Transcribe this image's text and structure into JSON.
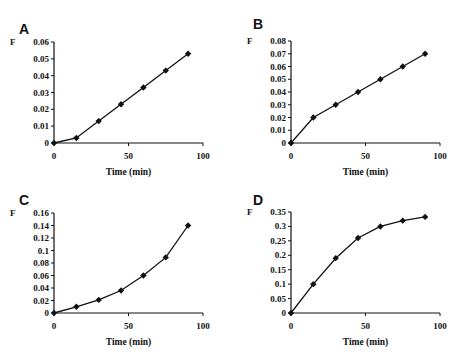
{
  "chart_data": [
    {
      "id": "A",
      "type": "line",
      "title": "A",
      "xlabel": "Time (min)",
      "ylabel": "F",
      "x": [
        0,
        15,
        30,
        45,
        60,
        75,
        90
      ],
      "series": [
        {
          "name": "F",
          "values": [
            0,
            0.003,
            0.013,
            0.023,
            0.033,
            0.043,
            0.053
          ],
          "marker": "diamond"
        }
      ],
      "xlim": [
        0,
        100
      ],
      "ylim": [
        0,
        0.06
      ],
      "xticks": [
        0,
        50,
        100
      ],
      "xtick_labels": [
        "0",
        "50",
        "100"
      ],
      "yticks": [
        0,
        0.01,
        0.02,
        0.03,
        0.04,
        0.05,
        0.06
      ],
      "ytick_labels": [
        "0",
        "0.01",
        "0.02",
        "0.03",
        "0.04",
        "0.05",
        "0.06"
      ],
      "grid": false,
      "legend": null
    },
    {
      "id": "B",
      "type": "line",
      "title": "B",
      "xlabel": "Time (min)",
      "ylabel": "F",
      "x": [
        0,
        15,
        30,
        45,
        60,
        75,
        90
      ],
      "series": [
        {
          "name": "F",
          "values": [
            0,
            0.02,
            0.03,
            0.04,
            0.05,
            0.06,
            0.07
          ],
          "marker": "diamond"
        }
      ],
      "xlim": [
        0,
        100
      ],
      "ylim": [
        0,
        0.08
      ],
      "xticks": [
        0,
        50,
        100
      ],
      "xtick_labels": [
        "0",
        "50",
        "100"
      ],
      "yticks": [
        0,
        0.01,
        0.02,
        0.03,
        0.04,
        0.05,
        0.06,
        0.07,
        0.08
      ],
      "ytick_labels": [
        "0",
        "0.01",
        "0.02",
        "0.03",
        "0.04",
        "0.05",
        "0.06",
        "0.07",
        "0.08"
      ],
      "grid": false,
      "legend": null
    },
    {
      "id": "C",
      "type": "line",
      "title": "C",
      "xlabel": "Time (min)",
      "ylabel": "F",
      "x": [
        0,
        15,
        30,
        45,
        60,
        75,
        90
      ],
      "series": [
        {
          "name": "F",
          "values": [
            0,
            0.01,
            0.021,
            0.036,
            0.06,
            0.089,
            0.14
          ],
          "marker": "diamond"
        }
      ],
      "xlim": [
        0,
        100
      ],
      "ylim": [
        0,
        0.16
      ],
      "xticks": [
        0,
        50,
        100
      ],
      "xtick_labels": [
        "0",
        "50",
        "100"
      ],
      "yticks": [
        0,
        0.02,
        0.04,
        0.06,
        0.08,
        0.1,
        0.12,
        0.14,
        0.16
      ],
      "ytick_labels": [
        "0",
        "0.02",
        "0.04",
        "0.06",
        "0.08",
        "0.1",
        "0.12",
        "0.14",
        "0.16"
      ],
      "grid": false,
      "legend": null
    },
    {
      "id": "D",
      "type": "line",
      "title": "D",
      "xlabel": "Time (min)",
      "ylabel": "F",
      "x": [
        0,
        15,
        30,
        45,
        60,
        75,
        90
      ],
      "series": [
        {
          "name": "F",
          "values": [
            0,
            0.1,
            0.19,
            0.26,
            0.3,
            0.32,
            0.333
          ],
          "marker": "diamond"
        }
      ],
      "xlim": [
        0,
        100
      ],
      "ylim": [
        0,
        0.35
      ],
      "xticks": [
        0,
        50,
        100
      ],
      "xtick_labels": [
        "0",
        "50",
        "100"
      ],
      "yticks": [
        0,
        0.05,
        0.1,
        0.15,
        0.2,
        0.25,
        0.3,
        0.35
      ],
      "ytick_labels": [
        "0",
        "0.05",
        "0.1",
        "0.15",
        "0.2",
        "0.25",
        "0.3",
        "0.35"
      ],
      "grid": false,
      "legend": null
    }
  ],
  "panels": [
    {
      "letter": "A",
      "ylabel": "F",
      "xlabel": "Time (min)"
    },
    {
      "letter": "B",
      "ylabel": "F",
      "xlabel": "Time (min)"
    },
    {
      "letter": "C",
      "ylabel": "F",
      "xlabel": "Time (min)"
    },
    {
      "letter": "D",
      "ylabel": "F",
      "xlabel": "Time (min)"
    }
  ],
  "colors": {
    "line": "#111111",
    "marker": "#111111",
    "axis": "#111111",
    "background": "#ffffff"
  }
}
